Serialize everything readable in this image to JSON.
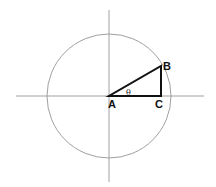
{
  "diagram": {
    "labels": {
      "A": "A",
      "B": "B",
      "C": "C",
      "angle": "θ"
    },
    "colors": {
      "axis": "#9a9a9a",
      "circle": "#9a9a9a",
      "triangle": "#111111"
    }
  }
}
